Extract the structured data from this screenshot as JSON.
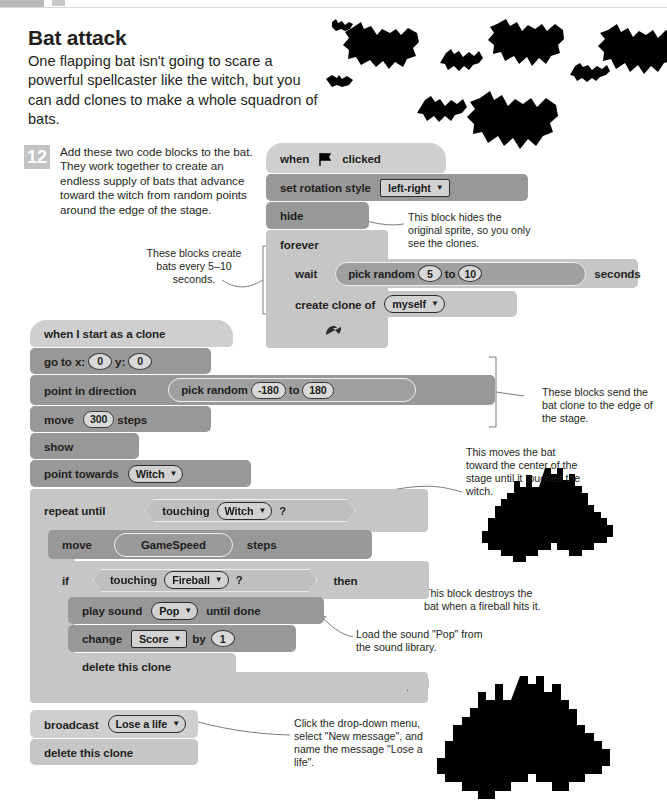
{
  "header": {
    "page_number": "174",
    "running_title": "DOOM ON THE BROOM"
  },
  "article": {
    "title": "Bat attack",
    "intro": "One flapping bat isn't going to scare a powerful spellcaster like the witch, but you can add clones to make a whole squadron of bats."
  },
  "step": {
    "number": "12",
    "text": "Add these two code blocks to the bat. They work together to create an endless supply of bats that advance toward the witch from random points around the edge of the stage."
  },
  "callouts": {
    "create_bats": "These blocks create bats every 5–10 seconds.",
    "hide_block": "This block hides the original sprite, so you only see the clones.",
    "send_to_edge": "These blocks send the bat clone to the edge of the stage.",
    "move_toward": "This moves the bat toward the center of the stage until it touches the witch.",
    "destroy_bat": "This block destroys the bat when a fireball hits it.",
    "load_sound": "Load the sound \"Pop\" from the sound library.",
    "broadcast_help": "Click the drop-down menu, select \"New message\", and name the message \"Lose a life\"."
  },
  "script_main": {
    "hat": {
      "when": "when",
      "clicked": "clicked",
      "icon": "green-flag-icon"
    },
    "set_rotation": {
      "label": "set rotation style",
      "value": "left-right"
    },
    "hide": {
      "label": "hide"
    },
    "forever": {
      "label": "forever"
    },
    "wait": {
      "label": "wait",
      "unit": "seconds"
    },
    "pick_random": {
      "label": "pick random",
      "from": "5",
      "to_label": "to",
      "to": "10"
    },
    "create_clone": {
      "label": "create clone of",
      "value": "myself"
    }
  },
  "script_clone": {
    "hat": {
      "label": "when I start as a clone"
    },
    "goto": {
      "label_x": "go to x:",
      "x": "0",
      "label_y": "y:",
      "y": "0"
    },
    "point_direction": {
      "label": "point in direction"
    },
    "pick_random": {
      "label": "pick random",
      "from": "-180",
      "to_label": "to",
      "to": "180"
    },
    "move300": {
      "label": "move",
      "value": "300",
      "unit": "steps"
    },
    "show": {
      "label": "show"
    },
    "point_towards": {
      "label": "point towards",
      "value": "Witch"
    },
    "repeat_until": {
      "label": "repeat until"
    },
    "touching_witch": {
      "label": "touching",
      "value": "Witch",
      "q": "?"
    },
    "move_speed": {
      "label": "move",
      "value": "GameSpeed",
      "unit": "steps"
    },
    "if_block": {
      "label": "if",
      "then": "then"
    },
    "touching_fireball": {
      "label": "touching",
      "value": "Fireball",
      "q": "?"
    },
    "play_sound": {
      "label": "play sound",
      "value": "Pop",
      "suffix": "until done"
    },
    "change_score": {
      "label": "change",
      "value": "Score",
      "by": "by",
      "amount": "1"
    },
    "delete_clone_inner": {
      "label": "delete this clone"
    },
    "broadcast": {
      "label": "broadcast",
      "value": "Lose a life"
    },
    "delete_clone_end": {
      "label": "delete this clone"
    }
  },
  "colors": {
    "block_light": "#cfcfcf",
    "block_control": "#c6c6c6",
    "block_motion": "#989898",
    "step_badge": "#c3c3c3",
    "bat_silhouette": "#000000"
  }
}
